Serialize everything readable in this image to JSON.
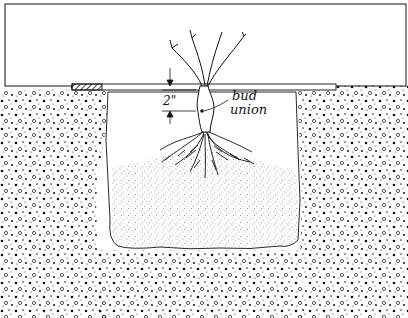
{
  "diagram": {
    "labels": {
      "depth": "2\"",
      "bud_union_line1": "bud",
      "bud_union_line2": "union"
    },
    "elements": [
      "background frame",
      "level board across hole",
      "ground surface soil",
      "planting hole walls",
      "mound of loose backfill soil",
      "rose roots spread over mound",
      "rose canes",
      "bud union",
      "depth dimension arrows"
    ],
    "colors": {
      "ink": "#111111",
      "paper": "#ffffff"
    }
  }
}
